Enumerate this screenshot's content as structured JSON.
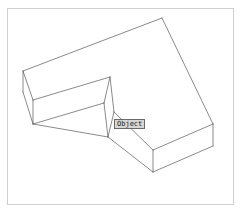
{
  "app": {
    "title": "Object wireframe viewport",
    "background_color": "#ffffff"
  },
  "frame": {
    "name": "drawing-frame",
    "border_color": "#cfcfcf",
    "fill_color": "#ffffff",
    "x": 7,
    "y": 8,
    "width": 226,
    "height": 196
  },
  "tooltip": {
    "label": "Object",
    "background_color": "#d6d6d6",
    "border_color": "#6a6a6a",
    "text_color": "#202020",
    "x": 114,
    "y": 119,
    "width": 28,
    "height": 10
  },
  "drawing": {
    "type": "isometric-wireframe",
    "shape": "L-shaped elbow solid",
    "stroke_color": "#585858",
    "stroke_width": 0.7,
    "fill_color": "none",
    "vertices": {
      "top_face": {
        "A_outer_left": [
          23,
          71
        ],
        "B_apex_top": [
          162,
          18
        ],
        "C_outer_right": [
          213,
          124
        ],
        "D_inner_right": [
          153,
          150
        ],
        "E_inner_corner": [
          114,
          112
        ],
        "F_inner_left": [
          110,
          77
        ],
        "G_outer_left_front": [
          33,
          100
        ]
      },
      "bottom_face": {
        "A2": [
          23,
          92
        ],
        "G2": [
          33,
          124
        ],
        "D2": [
          153,
          172
        ],
        "C2": [
          213,
          146
        ],
        "E2": [
          108,
          137
        ],
        "F2": [
          110,
          77
        ]
      }
    },
    "edges": [
      {
        "name": "top-back-left",
        "from": [
          23,
          71
        ],
        "to": [
          162,
          18
        ]
      },
      {
        "name": "top-right-upper",
        "from": [
          162,
          18
        ],
        "to": [
          213,
          124
        ]
      },
      {
        "name": "top-right-lower",
        "from": [
          213,
          124
        ],
        "to": [
          153,
          150
        ]
      },
      {
        "name": "top-inner-lower",
        "from": [
          153,
          150
        ],
        "to": [
          114,
          112
        ]
      },
      {
        "name": "top-inner-horizontal",
        "from": [
          114,
          112
        ],
        "to": [
          110,
          77
        ]
      },
      {
        "name": "top-front-left",
        "from": [
          110,
          77
        ],
        "to": [
          33,
          100
        ]
      },
      {
        "name": "top-left-end",
        "from": [
          33,
          100
        ],
        "to": [
          23,
          71
        ]
      },
      {
        "name": "vert-outer-left-back",
        "from": [
          23,
          71
        ],
        "to": [
          23,
          92
        ]
      },
      {
        "name": "vert-outer-left-front",
        "from": [
          33,
          100
        ],
        "to": [
          33,
          124
        ]
      },
      {
        "name": "vert-inner-corner",
        "from": [
          114,
          112
        ],
        "to": [
          108,
          137
        ]
      },
      {
        "name": "vert-inner-front",
        "from": [
          110,
          77
        ],
        "to": [
          110,
          77
        ]
      },
      {
        "name": "vert-outer-right",
        "from": [
          213,
          124
        ],
        "to": [
          213,
          146
        ]
      },
      {
        "name": "vert-bottom-front",
        "from": [
          153,
          150
        ],
        "to": [
          153,
          172
        ]
      },
      {
        "name": "bottom-left-end",
        "from": [
          23,
          92
        ],
        "to": [
          33,
          124
        ]
      },
      {
        "name": "bottom-front-left",
        "from": [
          33,
          124
        ],
        "to": [
          108,
          137
        ]
      },
      {
        "name": "bottom-inner-lower",
        "from": [
          108,
          137
        ],
        "to": [
          153,
          172
        ]
      },
      {
        "name": "bottom-right-lower",
        "from": [
          153,
          172
        ],
        "to": [
          213,
          146
        ]
      }
    ]
  }
}
